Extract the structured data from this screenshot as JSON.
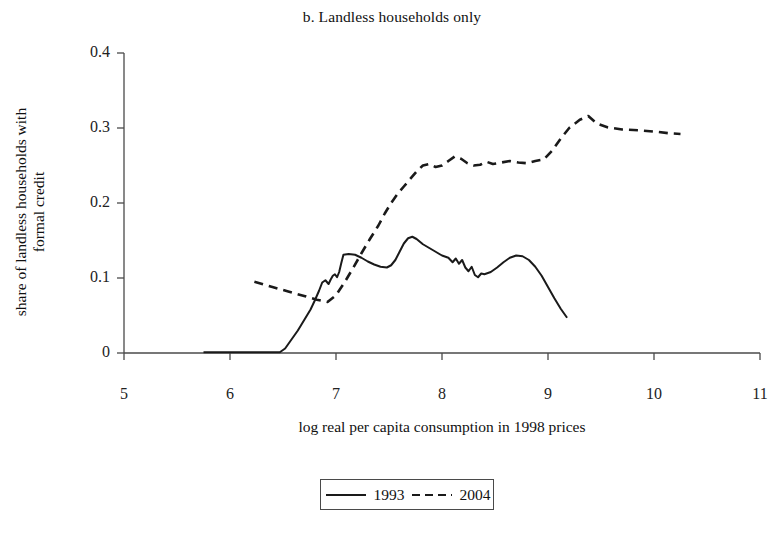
{
  "chart_data": {
    "type": "line",
    "title": "b. Landless households only",
    "xlabel": "log real per capita consumption in 1998 prices",
    "ylabel_line1": "share of landless households with",
    "ylabel_line2": "formal credit",
    "xlim": [
      5,
      11
    ],
    "ylim": [
      0,
      0.4
    ],
    "xticks": [
      "5",
      "6",
      "7",
      "8",
      "9",
      "10",
      "11"
    ],
    "xtick_values": [
      5,
      6,
      7,
      8,
      9,
      10,
      11
    ],
    "yticks": [
      "0",
      "0.1",
      "0.2",
      "0.3",
      "0.4"
    ],
    "ytick_values": [
      0,
      0.1,
      0.2,
      0.3,
      0.4
    ],
    "grid": false,
    "legend_position": "below-center",
    "series": [
      {
        "name": "1993",
        "style": "solid",
        "color": "#1a1a1a",
        "points": [
          [
            5.75,
            0.001
          ],
          [
            6.0,
            0.001
          ],
          [
            6.2,
            0.001
          ],
          [
            6.35,
            0.001
          ],
          [
            6.47,
            0.001
          ],
          [
            6.52,
            0.006
          ],
          [
            6.58,
            0.018
          ],
          [
            6.64,
            0.03
          ],
          [
            6.7,
            0.044
          ],
          [
            6.76,
            0.058
          ],
          [
            6.8,
            0.07
          ],
          [
            6.84,
            0.083
          ],
          [
            6.87,
            0.094
          ],
          [
            6.9,
            0.097
          ],
          [
            6.93,
            0.092
          ],
          [
            6.95,
            0.098
          ],
          [
            6.97,
            0.103
          ],
          [
            6.99,
            0.105
          ],
          [
            7.01,
            0.101
          ],
          [
            7.03,
            0.108
          ],
          [
            7.05,
            0.12
          ],
          [
            7.07,
            0.131
          ],
          [
            7.12,
            0.132
          ],
          [
            7.18,
            0.131
          ],
          [
            7.24,
            0.127
          ],
          [
            7.3,
            0.122
          ],
          [
            7.36,
            0.118
          ],
          [
            7.42,
            0.115
          ],
          [
            7.48,
            0.114
          ],
          [
            7.52,
            0.117
          ],
          [
            7.56,
            0.124
          ],
          [
            7.6,
            0.135
          ],
          [
            7.64,
            0.146
          ],
          [
            7.68,
            0.153
          ],
          [
            7.72,
            0.155
          ],
          [
            7.76,
            0.152
          ],
          [
            7.82,
            0.145
          ],
          [
            7.88,
            0.14
          ],
          [
            7.94,
            0.135
          ],
          [
            8.0,
            0.13
          ],
          [
            8.06,
            0.127
          ],
          [
            8.1,
            0.121
          ],
          [
            8.13,
            0.126
          ],
          [
            8.16,
            0.119
          ],
          [
            8.19,
            0.124
          ],
          [
            8.22,
            0.114
          ],
          [
            8.25,
            0.109
          ],
          [
            8.28,
            0.115
          ],
          [
            8.31,
            0.104
          ],
          [
            8.34,
            0.101
          ],
          [
            8.37,
            0.106
          ],
          [
            8.4,
            0.105
          ],
          [
            8.46,
            0.108
          ],
          [
            8.52,
            0.114
          ],
          [
            8.58,
            0.121
          ],
          [
            8.64,
            0.127
          ],
          [
            8.7,
            0.13
          ],
          [
            8.76,
            0.129
          ],
          [
            8.82,
            0.124
          ],
          [
            8.88,
            0.115
          ],
          [
            8.94,
            0.103
          ],
          [
            9.0,
            0.088
          ],
          [
            9.06,
            0.073
          ],
          [
            9.12,
            0.059
          ],
          [
            9.18,
            0.047
          ]
        ]
      },
      {
        "name": "2004",
        "style": "dashed",
        "color": "#1a1a1a",
        "points": [
          [
            6.23,
            0.095
          ],
          [
            6.4,
            0.088
          ],
          [
            6.55,
            0.082
          ],
          [
            6.7,
            0.076
          ],
          [
            6.82,
            0.071
          ],
          [
            6.92,
            0.068
          ],
          [
            7.0,
            0.077
          ],
          [
            7.08,
            0.094
          ],
          [
            7.16,
            0.113
          ],
          [
            7.24,
            0.133
          ],
          [
            7.32,
            0.152
          ],
          [
            7.4,
            0.17
          ],
          [
            7.46,
            0.186
          ],
          [
            7.52,
            0.2
          ],
          [
            7.58,
            0.212
          ],
          [
            7.64,
            0.222
          ],
          [
            7.7,
            0.232
          ],
          [
            7.76,
            0.242
          ],
          [
            7.82,
            0.25
          ],
          [
            7.88,
            0.252
          ],
          [
            7.94,
            0.248
          ],
          [
            8.0,
            0.25
          ],
          [
            8.06,
            0.256
          ],
          [
            8.12,
            0.262
          ],
          [
            8.18,
            0.259
          ],
          [
            8.24,
            0.253
          ],
          [
            8.3,
            0.25
          ],
          [
            8.36,
            0.251
          ],
          [
            8.42,
            0.255
          ],
          [
            8.48,
            0.252
          ],
          [
            8.56,
            0.254
          ],
          [
            8.64,
            0.256
          ],
          [
            8.72,
            0.254
          ],
          [
            8.8,
            0.253
          ],
          [
            8.88,
            0.256
          ],
          [
            8.96,
            0.258
          ],
          [
            9.04,
            0.27
          ],
          [
            9.12,
            0.286
          ],
          [
            9.2,
            0.3
          ],
          [
            9.3,
            0.311
          ],
          [
            9.38,
            0.316
          ],
          [
            9.46,
            0.306
          ],
          [
            9.56,
            0.301
          ],
          [
            9.7,
            0.298
          ],
          [
            9.86,
            0.297
          ],
          [
            10.02,
            0.295
          ],
          [
            10.14,
            0.293
          ],
          [
            10.25,
            0.292
          ]
        ]
      }
    ],
    "legend": [
      {
        "label": "1993",
        "style": "solid"
      },
      {
        "label": "2004",
        "style": "dashed"
      }
    ]
  }
}
